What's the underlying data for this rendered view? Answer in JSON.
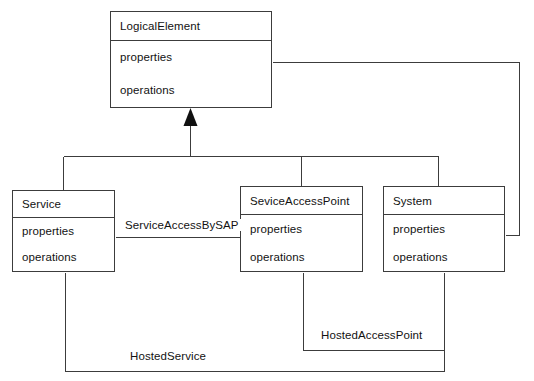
{
  "diagram": {
    "type": "uml-class-diagram",
    "background_color": "#ffffff",
    "line_color": "#3c3c3c",
    "text_color": "#121212",
    "width": 534,
    "height": 381
  },
  "classes": [
    {
      "id": "logical-element",
      "name": "LogicalElement",
      "attributes": [
        "properties",
        "operations"
      ],
      "x": 110,
      "y": 11,
      "w": 162,
      "h": 97
    },
    {
      "id": "service",
      "name": "Service",
      "attributes": [
        "properties",
        "operations"
      ],
      "x": 12,
      "y": 190,
      "w": 103,
      "h": 82
    },
    {
      "id": "sevice-access-point",
      "name": "SeviceAccessPoint",
      "attributes": [
        "properties",
        "operations"
      ],
      "x": 240,
      "y": 186,
      "w": 123,
      "h": 86
    },
    {
      "id": "system",
      "name": "System",
      "attributes": [
        "properties",
        "operations"
      ],
      "x": 383,
      "y": 186,
      "w": 122,
      "h": 86
    }
  ],
  "relationships": [
    {
      "id": "generalization",
      "kind": "generalization",
      "label": "",
      "from": [
        "Service",
        "SeviceAccessPoint",
        "System"
      ],
      "to": "LogicalElement"
    },
    {
      "id": "service-access-by-sap",
      "kind": "association",
      "label": "ServiceAccessBySAP",
      "from": "Service",
      "to": "SeviceAccessPoint",
      "label_x": 122,
      "label_y": 219
    },
    {
      "id": "hosted-access-point",
      "kind": "association",
      "label": "HostedAccessPoint",
      "from": "SeviceAccessPoint",
      "to": "System",
      "label_x": 318,
      "label_y": 329
    },
    {
      "id": "hosted-service",
      "kind": "association",
      "label": "HostedService",
      "from": "Service",
      "to": "System",
      "label_x": 127,
      "label_y": 350
    },
    {
      "id": "system-logical-element",
      "kind": "association",
      "label": "",
      "from": "System",
      "to": "LogicalElement"
    }
  ]
}
